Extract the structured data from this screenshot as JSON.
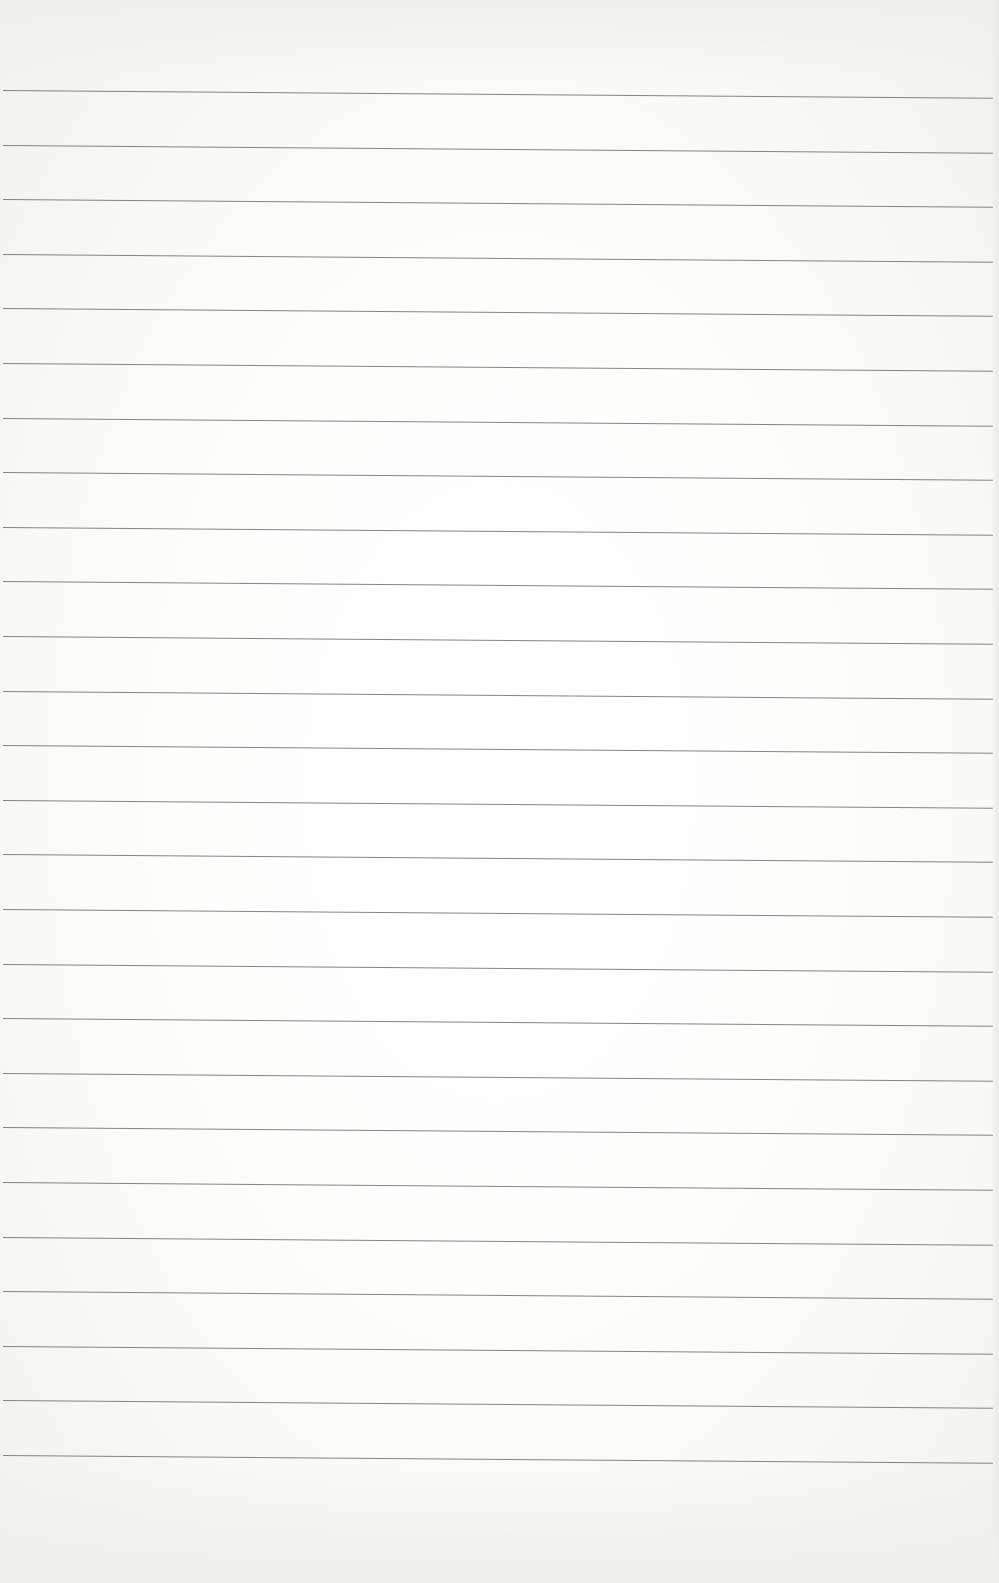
{
  "page": {
    "type": "blank-lined-paper",
    "line_count": 26,
    "first_line_y": 90,
    "line_spacing": 54.6,
    "line_color": "#6e6e6e",
    "paper_color": "#fbfbfa"
  }
}
